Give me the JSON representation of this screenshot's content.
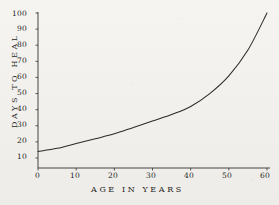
{
  "chart_data": {
    "type": "line",
    "title": "",
    "subtitle": "",
    "xlabel": "AGE IN YEARS",
    "ylabel": "DAYS TO HEAL",
    "xlim": [
      0,
      60
    ],
    "ylim": [
      0,
      100
    ],
    "xticks": [
      "0",
      "10",
      "20",
      "30",
      "40",
      "50",
      "60"
    ],
    "xtick_values": [
      0,
      10,
      20,
      30,
      40,
      50,
      60
    ],
    "yticks": [
      "10",
      "20",
      "30",
      "40",
      "50",
      "60",
      "70",
      "80",
      "90",
      "100"
    ],
    "ytick_values": [
      10,
      20,
      30,
      40,
      50,
      60,
      70,
      80,
      90,
      100
    ],
    "grid": false,
    "legend": null,
    "legend_position": "none",
    "annotations": [],
    "series": [
      {
        "name": "Days to heal",
        "x": [
          0,
          5,
          10,
          15,
          20,
          25,
          30,
          35,
          40,
          45,
          50,
          55,
          60
        ],
        "values": [
          14,
          16,
          19,
          22,
          25,
          29,
          33,
          37,
          42,
          50,
          61,
          77,
          100
        ]
      }
    ],
    "colors": {
      "ink": "#2b2a28",
      "paper": "#f3f2ef",
      "curve": "#2b2a28",
      "axis": "#33322f"
    }
  },
  "figure": {
    "xlabel": "AGE IN YEARS",
    "ylabel": "DAYS TO HEAL"
  }
}
